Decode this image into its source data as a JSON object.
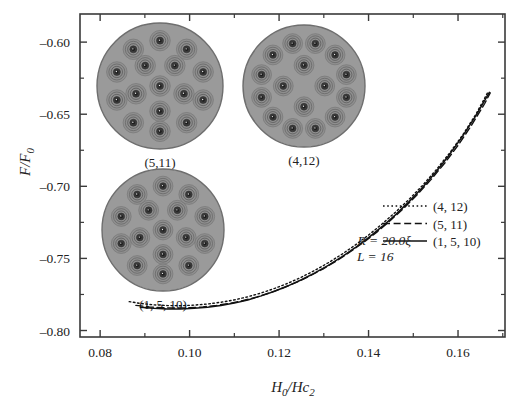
{
  "chart_data": {
    "type": "line",
    "title": "",
    "xlabel": "H0/Hc2",
    "ylabel": "F/F0",
    "xlim": [
      0.0755,
      0.1705
    ],
    "ylim": [
      -0.8045,
      -0.5805
    ],
    "xticks": [
      "0.08",
      "0.10",
      "0.12",
      "0.14",
      "0.16"
    ],
    "xtick_values": [
      0.08,
      0.1,
      0.12,
      0.14,
      0.16
    ],
    "yticks": [
      "–0.60",
      "–0.65",
      "–0.70",
      "–0.75",
      "–0.80"
    ],
    "ytick_values": [
      -0.6,
      -0.65,
      -0.7,
      -0.75,
      -0.8
    ],
    "minor_ticks": true,
    "grid": false,
    "legend_position": "right-middle",
    "series": [
      {
        "name": "(4, 12)",
        "style": "dotted",
        "color": "#111111",
        "x": [
          0.0865,
          0.089,
          0.092,
          0.095,
          0.098,
          0.101,
          0.104,
          0.107,
          0.11,
          0.113,
          0.116,
          0.119,
          0.122,
          0.125,
          0.128,
          0.131,
          0.134,
          0.137,
          0.14,
          0.143,
          0.146,
          0.149,
          0.152,
          0.155,
          0.158,
          0.161,
          0.164,
          0.1668
        ],
        "y": [
          -0.78,
          -0.7812,
          -0.7822,
          -0.7827,
          -0.7828,
          -0.7824,
          -0.7816,
          -0.7804,
          -0.7788,
          -0.7766,
          -0.774,
          -0.7708,
          -0.7672,
          -0.763,
          -0.7583,
          -0.753,
          -0.7472,
          -0.7408,
          -0.7338,
          -0.7262,
          -0.718,
          -0.7092,
          -0.6996,
          -0.689,
          -0.6774,
          -0.6646,
          -0.65,
          -0.634
        ]
      },
      {
        "name": "(5, 11)",
        "style": "dashed",
        "color": "#111111",
        "x": [
          0.088,
          0.091,
          0.094,
          0.097,
          0.1,
          0.103,
          0.106,
          0.109,
          0.112,
          0.115,
          0.118,
          0.121,
          0.124,
          0.127,
          0.13,
          0.133,
          0.136,
          0.139,
          0.142,
          0.145,
          0.148,
          0.151,
          0.154,
          0.157,
          0.16,
          0.163,
          0.166,
          0.1672
        ],
        "y": [
          -0.7826,
          -0.7836,
          -0.7842,
          -0.7844,
          -0.7842,
          -0.7836,
          -0.7826,
          -0.7812,
          -0.7792,
          -0.7768,
          -0.7738,
          -0.7704,
          -0.7664,
          -0.762,
          -0.757,
          -0.7514,
          -0.7452,
          -0.7386,
          -0.7314,
          -0.7234,
          -0.7148,
          -0.7054,
          -0.6952,
          -0.684,
          -0.6716,
          -0.6578,
          -0.6424,
          -0.6352
        ]
      },
      {
        "name": "(1, 5, 10)",
        "style": "solid",
        "color": "#111111",
        "x": [
          0.089,
          0.092,
          0.095,
          0.098,
          0.101,
          0.104,
          0.107,
          0.11,
          0.113,
          0.116,
          0.119,
          0.122,
          0.125,
          0.128,
          0.131,
          0.134,
          0.137,
          0.14,
          0.143,
          0.146,
          0.149,
          0.152,
          0.155,
          0.158,
          0.161,
          0.164,
          0.167
        ],
        "y": [
          -0.7838,
          -0.7846,
          -0.785,
          -0.785,
          -0.7846,
          -0.7838,
          -0.7826,
          -0.781,
          -0.7788,
          -0.776,
          -0.7728,
          -0.769,
          -0.7648,
          -0.76,
          -0.7548,
          -0.749,
          -0.7426,
          -0.7356,
          -0.728,
          -0.7198,
          -0.7108,
          -0.701,
          -0.6902,
          -0.6784,
          -0.6654,
          -0.651,
          -0.6348
        ]
      }
    ],
    "annotations": [
      {
        "text": "R = 20.0ξ",
        "x": 0.1435,
        "y": -0.7405
      },
      {
        "text": "L = 16",
        "x": 0.1435,
        "y": -0.7515
      }
    ]
  },
  "legend": {
    "entries": [
      {
        "label": "(4, 12)",
        "style": "dotted"
      },
      {
        "label": "(5, 11)",
        "style": "dashed"
      },
      {
        "label": "(1, 5, 10)",
        "style": "solid"
      }
    ]
  },
  "annotations": {
    "radius": "R = 20.0ξ",
    "angular_momentum": "L = 16"
  },
  "insets": [
    {
      "caption": "(5,11)",
      "shells": [
        1,
        5,
        10
      ],
      "total_vortices": 16,
      "disk_color": "#9a9a9a",
      "cx": 160,
      "cy": 86,
      "r": 63
    },
    {
      "caption": "(4,12)",
      "shells": [
        4,
        12
      ],
      "total_vortices": 16,
      "disk_color": "#9a9a9a",
      "cx": 304,
      "cy": 86,
      "r": 61
    },
    {
      "caption": "(1, 5, 10)",
      "shells": [
        1,
        5,
        10
      ],
      "total_vortices": 16,
      "disk_color": "#9a9a9a",
      "cx": 163,
      "cy": 230,
      "r": 61
    }
  ],
  "axes": {
    "ylabel_main": "F",
    "ylabel_den": "F",
    "ylabel_sub": "0",
    "xlabel_h": "H",
    "xlabel_hsub": "0",
    "xlabel_hc": "Hc",
    "xlabel_hcsub": "2"
  },
  "colors": {
    "background": "#ffffff",
    "frame": "#3a3a3a",
    "curve": "#111111",
    "disk_fill": "#9a9a9a",
    "disk_edge": "#6e6e6e",
    "vortex_core": "#1d1d1d"
  }
}
